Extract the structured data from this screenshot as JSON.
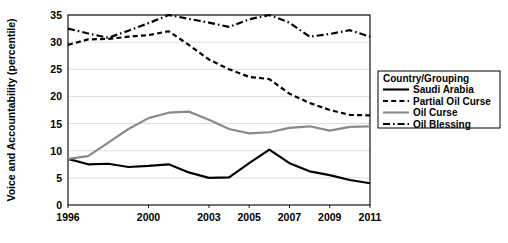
{
  "chart_data": {
    "type": "line",
    "title": "",
    "xlabel": "",
    "ylabel": "Voice and Accountability (percentile)",
    "xlim": [
      1996,
      2011
    ],
    "ylim": [
      0,
      35
    ],
    "yticks": [
      0,
      5,
      10,
      15,
      20,
      25,
      30,
      35
    ],
    "xticks": [
      1996,
      2000,
      2003,
      2005,
      2007,
      2009,
      2011
    ],
    "xtick_labels": [
      "1996",
      "2000",
      "2003",
      "2005",
      "2007",
      "2009",
      "2011"
    ],
    "ytick_labels": [
      "0",
      "5",
      "10",
      "15",
      "20",
      "25",
      "30",
      "35"
    ],
    "grid": true,
    "grid_axis": "y",
    "legend_position": "right-inside",
    "legend_title": "Country/Grouping",
    "x": [
      1996,
      1997,
      1998,
      1999,
      2000,
      2001,
      2002,
      2003,
      2004,
      2005,
      2006,
      2007,
      2008,
      2009,
      2010,
      2011
    ],
    "series": [
      {
        "name": "Saudi Arabia",
        "style": "solid",
        "color": "#000000",
        "width": 2.2,
        "values": [
          8.5,
          7.5,
          7.6,
          7.0,
          7.2,
          7.5,
          6.0,
          5.0,
          5.1,
          7.7,
          10.2,
          7.7,
          6.2,
          5.5,
          4.6,
          4.0
        ]
      },
      {
        "name": "Partial Oil Curse",
        "style": "dashed",
        "color": "#000000",
        "width": 2.2,
        "values": [
          29.5,
          30.5,
          30.6,
          31.0,
          31.3,
          32.0,
          29.5,
          26.8,
          25.0,
          23.6,
          23.2,
          20.5,
          18.8,
          17.5,
          16.6,
          16.5
        ]
      },
      {
        "name": "Oil Curse",
        "style": "solid",
        "color": "#8a8a8a",
        "width": 2.2,
        "values": [
          8.5,
          9.0,
          11.5,
          14.0,
          16.0,
          17.0,
          17.2,
          15.7,
          14.0,
          13.2,
          13.4,
          14.2,
          14.5,
          13.7,
          14.4,
          14.5
        ]
      },
      {
        "name": "Oil Blessing",
        "style": "dashdot",
        "color": "#000000",
        "width": 2.2,
        "values": [
          32.5,
          31.6,
          30.8,
          32.1,
          33.5,
          35.0,
          34.3,
          33.6,
          32.8,
          34.2,
          35.0,
          33.6,
          31.0,
          31.5,
          32.2,
          31.0
        ]
      }
    ]
  },
  "legend": {
    "title": "Country/Grouping",
    "items": [
      {
        "label": "Saudi Arabia",
        "style": "solid",
        "color": "#000000"
      },
      {
        "label": "Partial Oil Curse",
        "style": "dashed",
        "color": "#000000"
      },
      {
        "label": "Oil Curse",
        "style": "solid",
        "color": "#8a8a8a"
      },
      {
        "label": "Oil Blessing",
        "style": "dashdot",
        "color": "#000000"
      }
    ]
  },
  "axis": {
    "y_title": "Voice and Accountability (percentile)"
  },
  "colors": {
    "axis": "#000000",
    "grid": "#d9d9d9",
    "background": "#ffffff",
    "series_dark": "#000000",
    "series_gray": "#8a8a8a"
  }
}
